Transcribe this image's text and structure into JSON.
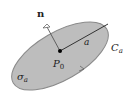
{
  "diagram": {
    "labels": {
      "normal": "n",
      "radius": "a",
      "center": "P",
      "center_sub": "0",
      "boundary": "C",
      "boundary_sub": "a",
      "surface": "σ",
      "surface_sub": "a"
    },
    "colors": {
      "disk_fill": "#bdbdbd",
      "disk_stroke": "#8a8a8a",
      "line": "#333333",
      "point": "#000000",
      "background": "#ffffff"
    }
  }
}
